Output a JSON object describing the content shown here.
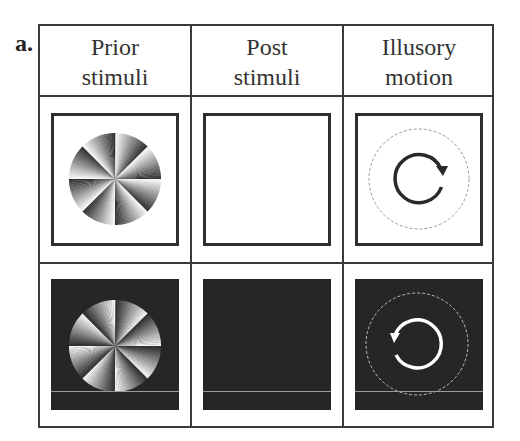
{
  "figure": {
    "panel_label": "a.",
    "columns": [
      {
        "line1": "Prior",
        "line2": "stimuli"
      },
      {
        "line1": "Post",
        "line2": "stimuli"
      },
      {
        "line1": "Illusory",
        "line2": "motion"
      }
    ],
    "rows": [
      {
        "background": "white",
        "prior_stimulus": "sawtooth-pinwheel-8-sectors-light-to-dark-clockwise",
        "post_stimulus": "blank-white",
        "illusory_motion": "clockwise"
      },
      {
        "background": "black",
        "prior_stimulus": "sawtooth-pinwheel-8-sectors-dark-to-light-clockwise",
        "post_stimulus": "blank-black",
        "illusory_motion": "counterclockwise"
      }
    ],
    "colors": {
      "grid_line": "#3a3a3a",
      "dark_background": "#262626",
      "arrow_on_light": "#2a2a2a",
      "arrow_on_dark": "#ffffff",
      "dashed_circle_on_light": "#9a9a9a",
      "dashed_circle_on_dark": "#bdbdbd"
    }
  }
}
